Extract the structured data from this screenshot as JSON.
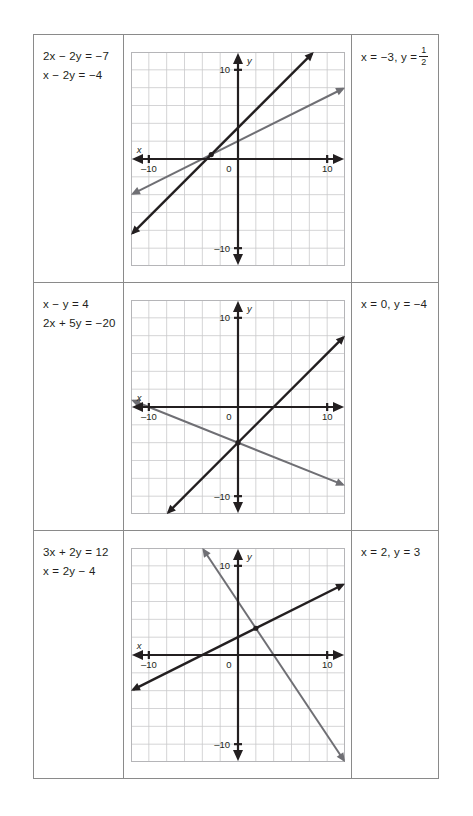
{
  "page": {
    "background": "#ffffff",
    "ink": "#231f20",
    "grid_color": "#c9c9cc",
    "line_dark_color": "#231f20",
    "line_grey_color": "#6f6f74"
  },
  "rows": [
    {
      "equations": [
        "2x − 2y = −7",
        "x − 2y = −4"
      ],
      "answer": {
        "prefix": "x = −3, y = ",
        "fraction": {
          "numerator": "1",
          "denominator": "2"
        }
      },
      "chart_data": {
        "type": "line",
        "title": "",
        "xlabel": "x",
        "ylabel": "y",
        "xlim": [
          -12,
          12
        ],
        "ylim": [
          -12,
          12
        ],
        "xticks": [
          -10,
          0,
          10
        ],
        "yticks": [
          10,
          -10
        ],
        "xtick_labels": [
          "–10",
          "0",
          "10"
        ],
        "ytick_labels": [
          "10",
          "–10"
        ],
        "grid": true,
        "grid_step": 2,
        "legend": "none",
        "series": [
          {
            "name": "2x − 2y = −7",
            "color": "#231f20",
            "slope": 1,
            "intercept": 3.5,
            "style": "arrow-both"
          },
          {
            "name": "x − 2y = −4",
            "color": "#6f6f74",
            "slope": 0.5,
            "intercept": 2,
            "style": "arrow-both"
          }
        ],
        "solution_point": [
          -3,
          0.5
        ],
        "annotations": [
          "intersection at x = −3, y = 1/2"
        ]
      }
    },
    {
      "equations": [
        "x − y = 4",
        "2x + 5y = −20"
      ],
      "answer": {
        "prefix": "x = 0, y = −4",
        "fraction": null
      },
      "chart_data": {
        "type": "line",
        "title": "",
        "xlabel": "x",
        "ylabel": "y",
        "xlim": [
          -12,
          12
        ],
        "ylim": [
          -12,
          12
        ],
        "xticks": [
          -10,
          0,
          10
        ],
        "yticks": [
          10,
          -10
        ],
        "xtick_labels": [
          "–10",
          "0",
          "10"
        ],
        "ytick_labels": [
          "10",
          "–10"
        ],
        "grid": true,
        "grid_step": 2,
        "legend": "none",
        "series": [
          {
            "name": "x − y = 4",
            "color": "#231f20",
            "slope": 1,
            "intercept": -4,
            "style": "arrow-both"
          },
          {
            "name": "2x + 5y = −20",
            "color": "#6f6f74",
            "slope": -0.4,
            "intercept": -4,
            "style": "arrow-both"
          }
        ],
        "solution_point": [
          0,
          -4
        ],
        "annotations": [
          "intersection at x = 0, y = −4"
        ]
      }
    },
    {
      "equations": [
        "3x + 2y = 12",
        "x = 2y − 4"
      ],
      "answer": {
        "prefix": "x = 2, y = 3",
        "fraction": null
      },
      "chart_data": {
        "type": "line",
        "title": "",
        "xlabel": "x",
        "ylabel": "y",
        "xlim": [
          -12,
          12
        ],
        "ylim": [
          -12,
          12
        ],
        "xticks": [
          -10,
          0,
          10
        ],
        "yticks": [
          10,
          -10
        ],
        "xtick_labels": [
          "–10",
          "0",
          "10"
        ],
        "ytick_labels": [
          "10",
          "–10"
        ],
        "grid": true,
        "grid_step": 2,
        "legend": "none",
        "series": [
          {
            "name": "x = 2y − 4",
            "color": "#231f20",
            "slope": 0.5,
            "intercept": 2,
            "style": "arrow-both"
          },
          {
            "name": "3x + 2y = 12",
            "color": "#6f6f74",
            "slope": -1.5,
            "intercept": 6,
            "style": "arrow-both"
          }
        ],
        "solution_point": [
          2,
          3
        ],
        "annotations": [
          "intersection at x = 2, y = 3"
        ]
      }
    }
  ]
}
